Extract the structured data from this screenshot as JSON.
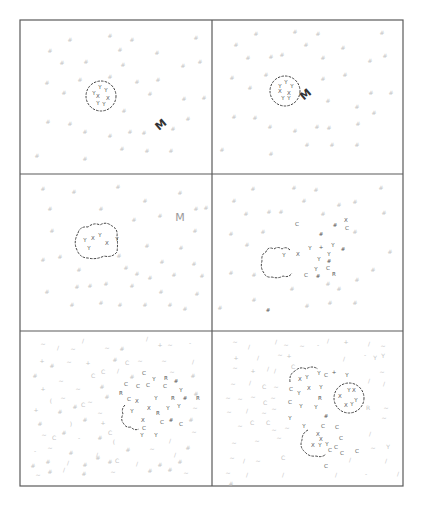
{
  "figure": {
    "layout": {
      "rows": 3,
      "cols": 2
    },
    "frame": {
      "left": 20,
      "top": 20,
      "right": 403,
      "bottom": 486,
      "mid_x": 212,
      "row_y": [
        174,
        331
      ]
    },
    "colors": {
      "frame": "#555555",
      "membrane": "#444444",
      "dark_glyph": "#444444",
      "faint_glyph": "#bbbbbb",
      "faint_M": "#999999"
    },
    "panels": [
      {
        "id": "panel-1",
        "label_M": "M",
        "cell": {
          "shape": "circle",
          "cx": 101,
          "cy": 96,
          "r": 16
        },
        "inner_glyphs": [
          "Y",
          "Y",
          "Y",
          "X",
          "X",
          "Y",
          "Y"
        ],
        "particle": {
          "text": "M",
          "x": 162,
          "y": 126,
          "rotate": -40,
          "faint": false
        }
      },
      {
        "id": "panel-2",
        "label_M": "M",
        "cell": {
          "shape": "circle",
          "cx": 285,
          "cy": 91,
          "r": 15
        },
        "inner_glyphs": [
          "Y",
          "Y",
          "Y",
          "X",
          "X",
          "Y",
          "Y"
        ],
        "particle": {
          "text": "M",
          "x": 305,
          "y": 95,
          "rotate": -40,
          "faint": false
        }
      },
      {
        "id": "panel-3",
        "label_M": "M",
        "cell": {
          "shape": "blob",
          "cx": 96,
          "cy": 240
        },
        "inner_glyphs": [
          "Y",
          "X",
          "Y",
          "X",
          "Y",
          "Y"
        ],
        "particle": {
          "text": "M",
          "x": 180,
          "y": 221,
          "rotate": 0,
          "faint": true
        }
      },
      {
        "id": "panel-4",
        "cell": {
          "shape": "open-blob",
          "cx": 290,
          "cy": 257
        },
        "inner_glyphs": [
          "Y",
          "X"
        ],
        "scattered_dark": [
          "#",
          "Y",
          "+",
          "Y",
          "Y",
          "#",
          "Y",
          "#",
          "R",
          "X",
          "C",
          "C",
          "#"
        ]
      },
      {
        "id": "panel-5",
        "cell": {
          "shape": "fragmented",
          "cx": 150,
          "cy": 405
        },
        "scattered_dark": [
          "C",
          "C",
          "C",
          "C",
          "Y",
          "R",
          "#",
          "Y",
          "R",
          "#",
          "R",
          "X",
          "Y",
          "X",
          "Y",
          "R",
          "#",
          "C",
          "Y",
          "C"
        ]
      },
      {
        "id": "panel-6",
        "cells": [
          {
            "shape": "fragmented",
            "cx": 308,
            "cy": 385
          },
          {
            "shape": "circle",
            "cx": 349,
            "cy": 398,
            "r": 16
          },
          {
            "shape": "fragmented",
            "cx": 323,
            "cy": 444
          }
        ],
        "inner_glyphs": [
          "X",
          "Y",
          "X",
          "Y",
          "X",
          "Y"
        ]
      }
    ]
  }
}
